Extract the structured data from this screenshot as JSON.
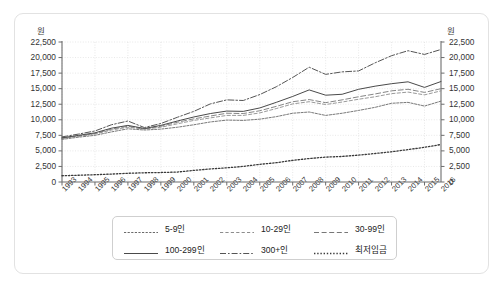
{
  "chart_data": {
    "type": "line",
    "title": "",
    "xlabel": "",
    "ylabel": "원",
    "ylabel_right": "원",
    "ylim": [
      0,
      22500
    ],
    "yticks": [
      0,
      2500,
      5000,
      7500,
      10000,
      12500,
      15000,
      17500,
      20000,
      22500
    ],
    "ytick_labels": [
      "0",
      "2,500",
      "5,000",
      "7,500",
      "10,000",
      "12,500",
      "15,000",
      "17,500",
      "20,000",
      "22,500"
    ],
    "grid": true,
    "legend_position": "bottom",
    "x": [
      1993,
      1994,
      1995,
      1996,
      1997,
      1998,
      1999,
      2000,
      2001,
      2002,
      2003,
      2004,
      2005,
      2006,
      2007,
      2008,
      2009,
      2010,
      2011,
      2012,
      2013,
      2014,
      2015,
      2016
    ],
    "xtick_labels": [
      "1993",
      "1994",
      "1995",
      "1996",
      "1997",
      "1998",
      "1999",
      "2000",
      "2001",
      "2002",
      "2003",
      "2004",
      "2005",
      "2006",
      "2007",
      "2008",
      "2009",
      "2010",
      "2011",
      "2012",
      "2013",
      "2014",
      "2015",
      "2016"
    ],
    "series": [
      {
        "name": "5-9인",
        "style": "dash-fine",
        "values": [
          6850,
          7200,
          7500,
          8050,
          8550,
          8350,
          8500,
          8800,
          9200,
          9650,
          9950,
          9900,
          10100,
          10500,
          11050,
          11250,
          10700,
          11050,
          11500,
          12000,
          12650,
          12800,
          12200,
          13000
        ]
      },
      {
        "name": "10-29인",
        "style": "dash-light",
        "values": [
          7000,
          7350,
          7700,
          8350,
          8800,
          8500,
          8800,
          9350,
          9900,
          10300,
          10700,
          10700,
          11100,
          11800,
          12550,
          12900,
          12450,
          12850,
          13300,
          13700,
          14200,
          14450,
          14000,
          14650
        ]
      },
      {
        "name": "30-99인",
        "style": "dash-long",
        "values": [
          7050,
          7400,
          7800,
          8500,
          8950,
          8550,
          8950,
          9600,
          10150,
          10600,
          11050,
          11000,
          11450,
          12150,
          12900,
          13250,
          12750,
          13200,
          13700,
          14150,
          14650,
          14900,
          14400,
          15000
        ]
      },
      {
        "name": "100-299인",
        "style": "solid",
        "values": [
          7100,
          7500,
          7900,
          8650,
          9100,
          8600,
          9100,
          9800,
          10450,
          11000,
          11400,
          11350,
          11900,
          12800,
          13750,
          14800,
          13950,
          14100,
          14900,
          15400,
          15800,
          16100,
          15200,
          16150
        ]
      },
      {
        "name": "300+인",
        "style": "dashdot",
        "values": [
          7250,
          7700,
          8200,
          9200,
          9800,
          8750,
          9400,
          10400,
          11350,
          12550,
          13200,
          13100,
          14050,
          15300,
          16800,
          18450,
          17300,
          17700,
          17850,
          19150,
          20300,
          21100,
          20500,
          21300
        ]
      },
      {
        "name": "최저임금",
        "style": "dotted",
        "values": [
          1005,
          1085,
          1170,
          1275,
          1400,
          1485,
          1525,
          1600,
          1865,
          2100,
          2275,
          2510,
          2840,
          3100,
          3480,
          3770,
          4000,
          4110,
          4320,
          4580,
          4860,
          5210,
          5580,
          6030
        ]
      }
    ],
    "minwage_display_note": ""
  },
  "legend": {
    "items": [
      {
        "label": "5-9인",
        "style": "dash-fine"
      },
      {
        "label": "10-29인",
        "style": "dash-light"
      },
      {
        "label": "30-99인",
        "style": "dash-long"
      },
      {
        "label": "100-299인",
        "style": "solid"
      },
      {
        "label": "300+인",
        "style": "dashdot"
      },
      {
        "label": "최저임금",
        "style": "dotted"
      }
    ]
  }
}
